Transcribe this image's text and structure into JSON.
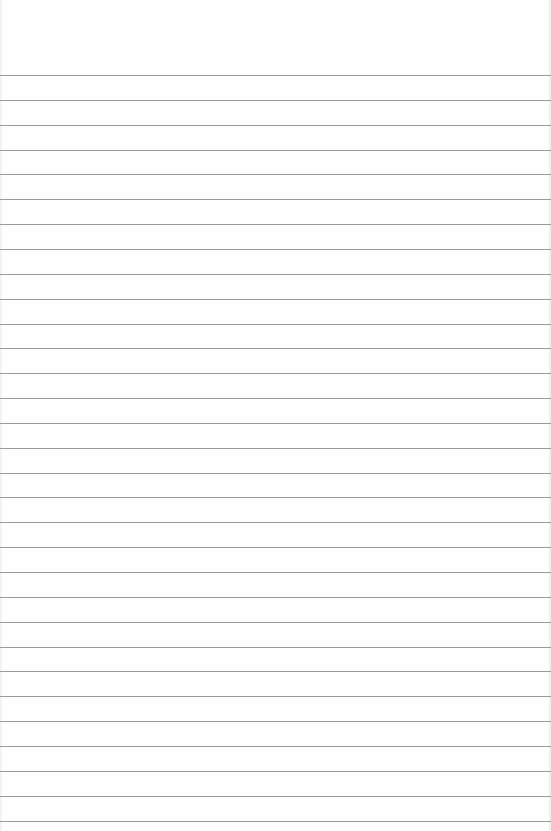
{
  "page": {
    "type": "lined-paper",
    "background_color": "#fefefe",
    "line_color": "#9a9a9a",
    "first_line_y": 75,
    "line_spacing": 24.85,
    "line_count": 31,
    "text": ""
  }
}
